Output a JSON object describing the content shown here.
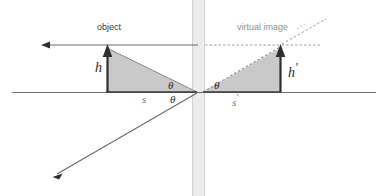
{
  "figure": {
    "title_semantic": "plane-mirror-virtual-image-ray-diagram",
    "background_color": "#ffffff",
    "labels": {
      "object": "object",
      "virtual_image": "virtual image",
      "object_height": "h",
      "image_height": "h",
      "image_height_prime": "'",
      "object_distance": "s",
      "image_distance": "s",
      "image_distance_prime": "'",
      "angle_incidence": "θ",
      "angle_reflection": "θ",
      "angle_image": "θ"
    },
    "colors": {
      "mirror_band": "#e8e8e8",
      "triangle_fill_object": "#c9c9c9",
      "triangle_fill_image": "#c9c9c9",
      "axis_line": "#6f6f6f",
      "ray_line": "#6a6a6a",
      "arrow_dark": "#2e2e2e",
      "dashed_line": "#9a9a9a",
      "text_dark": "#2b2b2b",
      "text_muted": "#8f8f8f"
    },
    "geometry": {
      "mirror_x": 198,
      "mirror_band_width": 13,
      "baseline_y": 92,
      "axis_x_start": 12,
      "axis_x_end": 376,
      "object_arrow_x": 107,
      "object_arrow_top_y": 45,
      "image_arrow_x": 280,
      "image_arrow_top_y": 45,
      "right_triangle_vertex_x": 203,
      "incident_ray_y": 45,
      "incident_arrow_tip_x": 41,
      "reflected_ray_tip": [
        53,
        177
      ],
      "dashed_horizontal_end_x": 322,
      "dashed_diagonal_end": [
        326,
        19
      ]
    }
  }
}
